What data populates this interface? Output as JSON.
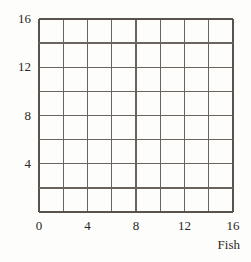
{
  "chart_data": {
    "type": "grid",
    "title": "",
    "subtitle": "",
    "xlabel": "Fish",
    "ylabel": "",
    "xlim": [
      0,
      16
    ],
    "ylim": [
      0,
      16
    ],
    "grid": true,
    "grid_step": 2,
    "x_cells": 8,
    "y_cells": 8,
    "legend": null,
    "annotations": [],
    "series": [],
    "x_ticks": [
      {
        "value": 0,
        "label": "0"
      },
      {
        "value": 2,
        "label": ""
      },
      {
        "value": 4,
        "label": "4"
      },
      {
        "value": 6,
        "label": ""
      },
      {
        "value": 8,
        "label": "8"
      },
      {
        "value": 10,
        "label": ""
      },
      {
        "value": 12,
        "label": "12"
      },
      {
        "value": 14,
        "label": ""
      },
      {
        "value": 16,
        "label": "16"
      }
    ],
    "y_ticks": [
      {
        "value": 0,
        "label": ""
      },
      {
        "value": 2,
        "label": ""
      },
      {
        "value": 4,
        "label": "4"
      },
      {
        "value": 6,
        "label": ""
      },
      {
        "value": 8,
        "label": "8"
      },
      {
        "value": 10,
        "label": ""
      },
      {
        "value": 12,
        "label": "12"
      },
      {
        "value": 14,
        "label": ""
      },
      {
        "value": 16,
        "label": "16"
      }
    ],
    "colors": {
      "background": "#fdfdfb",
      "grid_line": "#6b645e",
      "axis_line": "#5a534d",
      "text": "#2b2724"
    }
  }
}
